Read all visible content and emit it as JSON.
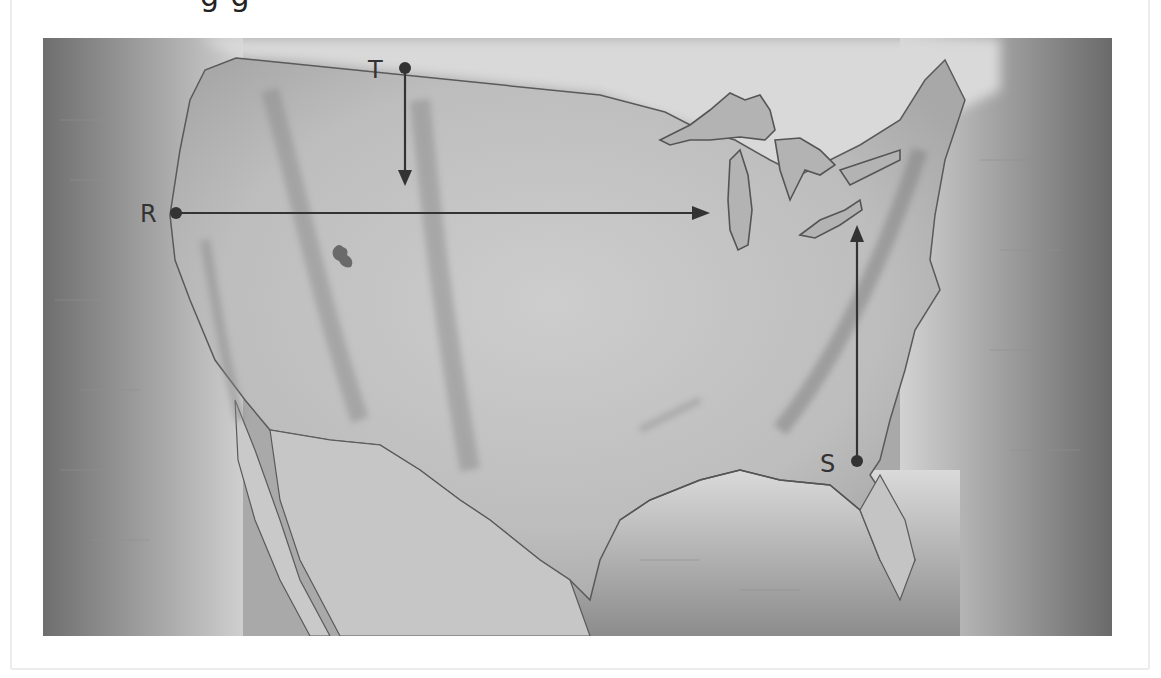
{
  "figure": {
    "clipped_title_text": "g g",
    "title_visible": false
  },
  "map": {
    "region": "Contiguous United States",
    "style": "grayscale relief map",
    "colors": {
      "land": "#b9b9b9",
      "land_light": "#d8d8d8",
      "water_dark": "#7c7c7c",
      "coast_line": "#555555",
      "arrow": "#333333"
    },
    "points": [
      {
        "id": "T",
        "label": "T",
        "x": 405,
        "y": 68
      },
      {
        "id": "R",
        "label": "R",
        "x": 176,
        "y": 213
      },
      {
        "id": "S",
        "label": "S",
        "x": 857,
        "y": 461
      }
    ],
    "arrows": [
      {
        "from": "T",
        "direction": "south",
        "x1": 405,
        "y1": 68,
        "x2": 405,
        "y2": 185
      },
      {
        "from": "R",
        "direction": "east",
        "x1": 176,
        "y1": 213,
        "x2": 710,
        "y2": 213
      },
      {
        "from": "S",
        "direction": "north",
        "x1": 857,
        "y1": 461,
        "x2": 857,
        "y2": 225
      }
    ]
  }
}
